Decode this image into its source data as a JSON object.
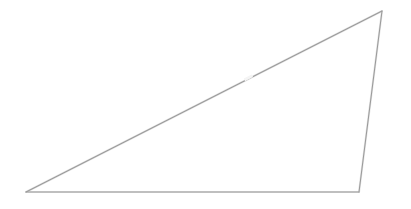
{
  "figure": {
    "kind": "line-drawing",
    "shape_name": "triangle",
    "background_color": "#ffffff",
    "canvas": {
      "width": 411,
      "height": 209
    },
    "stroke": {
      "color": "#9a9a9a",
      "soft_color": "#c4c4c4",
      "width": 1.05,
      "soft_width": 2.1,
      "opacity": 0.95
    },
    "vertices": [
      {
        "label": "A",
        "role": "bottom-left",
        "x": 26,
        "y": 192
      },
      {
        "label": "B",
        "role": "top-right-apex",
        "x": 382,
        "y": 11
      },
      {
        "label": "C",
        "role": "bottom-right",
        "x": 359,
        "y": 192
      }
    ],
    "edges": [
      {
        "name": "hypotenuse",
        "from": "A",
        "to": "B",
        "points": "26,192 382,11"
      },
      {
        "name": "right-side",
        "from": "B",
        "to": "C",
        "points": "382,11 359,192"
      },
      {
        "name": "base",
        "from": "C",
        "to": "A",
        "points": "359,192 26,192"
      }
    ],
    "polygon_points": "26,192 382,11 359,192",
    "artifacts": [
      {
        "name": "hypotenuse-speckle",
        "x": 248,
        "y": 78,
        "width": 9,
        "height": 3,
        "color": "#f2f2f2"
      }
    ],
    "fill": "none"
  }
}
